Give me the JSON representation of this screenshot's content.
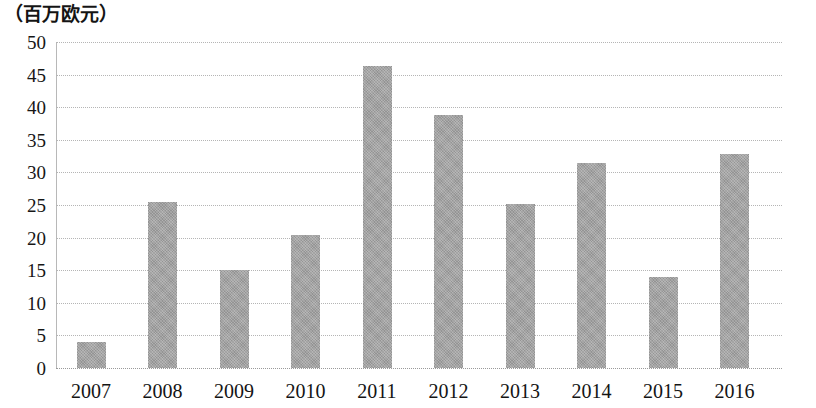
{
  "chart_data": {
    "type": "bar",
    "title": "",
    "subtitle": "",
    "xlabel": "（年）",
    "ylabel": "（百万欧元）",
    "categories": [
      "2007",
      "2008",
      "2009",
      "2010",
      "2011",
      "2012",
      "2013",
      "2014",
      "2015",
      "2016"
    ],
    "values": [
      4.0,
      25.5,
      15.1,
      20.4,
      46.3,
      38.8,
      25.2,
      31.4,
      13.9,
      32.8
    ],
    "ylim": [
      0,
      50
    ],
    "y_ticks": [
      "0",
      "5",
      "10",
      "15",
      "20",
      "25",
      "30",
      "35",
      "40",
      "45",
      "50"
    ],
    "y_tick_values": [
      0,
      5,
      10,
      15,
      20,
      25,
      30,
      35,
      40,
      45,
      50
    ],
    "grid": true,
    "grid_style": "dotted-horizontal",
    "legend": false,
    "legend_position": "none",
    "bar_color": "#a0a0a0",
    "grid_color": "#b5b5b5",
    "axis_color": "#b8b8b8",
    "text_color": "#161616",
    "background": "#ffffff"
  },
  "axis": {
    "y_unit_caption": "（百万欧元）",
    "x_unit_caption": "（年）"
  }
}
